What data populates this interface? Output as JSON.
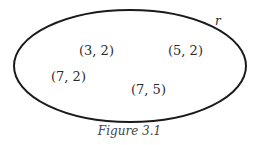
{
  "diagram": {
    "set_label": "r",
    "elements": [
      {
        "label": "(3, 2)",
        "x": 79,
        "y": 44
      },
      {
        "label": "(5, 2)",
        "x": 168,
        "y": 44
      },
      {
        "label": "(7, 2)",
        "x": 51,
        "y": 70
      },
      {
        "label": "(7, 5)",
        "x": 131,
        "y": 83
      }
    ],
    "caption": "Figure 3.1",
    "colors": {
      "stroke": "#1a1a1a",
      "text": "#2a2a2a"
    }
  }
}
